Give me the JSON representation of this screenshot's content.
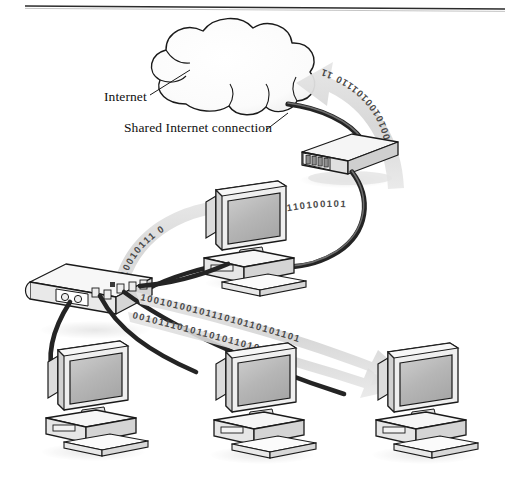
{
  "figure": {
    "top_rule": {
      "visible": true
    },
    "labels": [
      {
        "id": "internet",
        "text": "Internet",
        "x": 104,
        "y": 101
      },
      {
        "id": "shared-connection",
        "text": "Shared Internet connection",
        "x": 124,
        "y": 128
      }
    ],
    "nodes": [
      {
        "id": "internet-cloud",
        "type": "cloud",
        "label": "Internet"
      },
      {
        "id": "router",
        "type": "router",
        "label": "Router"
      },
      {
        "id": "hub",
        "type": "hub",
        "label": "Hub"
      },
      {
        "id": "computer-top",
        "type": "computer",
        "label": "Computer"
      },
      {
        "id": "computer-bottom-left",
        "type": "computer",
        "label": "Computer"
      },
      {
        "id": "computer-bottom-center",
        "type": "computer",
        "label": "Computer"
      },
      {
        "id": "computer-bottom-right",
        "type": "computer",
        "label": "Computer"
      }
    ],
    "data_flows": [
      {
        "id": "flow-router-to-cloud",
        "direction": "to-internet",
        "bits": "10010100101110 11"
      },
      {
        "id": "flow-router-to-computer-top",
        "direction": "to-computer",
        "bits": "110110100101"
      },
      {
        "id": "flow-hub-to-computer-top",
        "direction": "to-computer",
        "bits": "01010010111 0"
      },
      {
        "id": "flow-hub-to-computer-right-upper",
        "direction": "to-computer",
        "bits": "1001010010111010110101101"
      },
      {
        "id": "flow-hub-to-computer-right-lower",
        "direction": "to-computer",
        "bits": "0010111010110101101001"
      }
    ],
    "colors": {
      "outline": "#1a1a1a",
      "cable": "#242424",
      "screen": "#b8b8b8",
      "case_light": "#f2f2f2",
      "case_mid": "#d9d9d9",
      "case_dark": "#bdbdbd",
      "arrow_band": "#dcdcdc",
      "binary": "#4a4a4a",
      "shadow": "#e8e8e8",
      "rule": "#2b2b2b"
    }
  }
}
